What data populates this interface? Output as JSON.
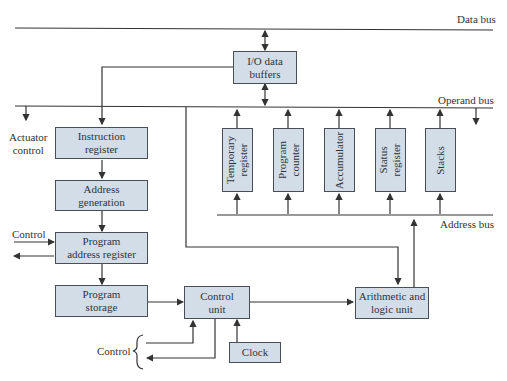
{
  "buses": {
    "data_bus": "Data bus",
    "operand_bus": "Operand bus",
    "address_bus": "Address bus"
  },
  "blocks": {
    "io_buffers": {
      "line1": "I/O data",
      "line2": "buffers"
    },
    "instruction_register": {
      "line1": "Instruction",
      "line2": "register"
    },
    "address_generation": {
      "line1": "Address",
      "line2": "generation"
    },
    "program_address_register": {
      "line1": "Program",
      "line2": "address register"
    },
    "program_storage": {
      "line1": "Program",
      "line2": "storage"
    },
    "control_unit": {
      "line1": "Control",
      "line2": "unit"
    },
    "clock": {
      "line1": "Clock"
    },
    "alu": {
      "line1": "Arithmetic and",
      "line2": "logic unit"
    },
    "temporary_register": {
      "line1": "Temporary",
      "line2": "register"
    },
    "program_counter": {
      "line1": "Program",
      "line2": "counter"
    },
    "accumulator": {
      "line1": "Accumulator"
    },
    "status_register": {
      "line1": "Status",
      "line2": "register"
    },
    "stacks": {
      "line1": "Stacks"
    }
  },
  "labels": {
    "actuator_control_1": "Actuator",
    "actuator_control_2": "control",
    "control_top": "Control",
    "control_bottom": "Control"
  },
  "colors": {
    "box_fill": "#d3dde8",
    "box_border": "#4a4f57",
    "line": "#333333"
  }
}
